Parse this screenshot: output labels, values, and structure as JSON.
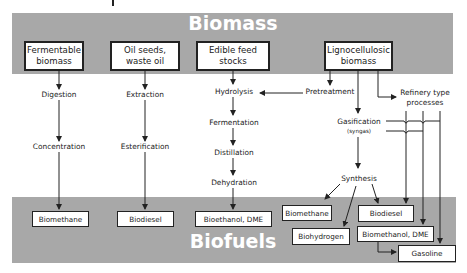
{
  "title_top": "Biomass",
  "title_bottom": "Biofuels",
  "sources": [
    {
      "label": "Fermentable biomass"
    },
    {
      "label": "Oil seeds, waste oil"
    },
    {
      "label": "Edible feed stocks"
    },
    {
      "label": "Lignocellulosic biomass"
    }
  ],
  "steps": {
    "digestion": "Digestion",
    "concentration": "Concentration",
    "extraction": "Extraction",
    "esterification": "Esterification",
    "hydrolysis": "Hydrolysis",
    "fermentation": "Fermentation",
    "distillation": "Distillation",
    "dehydration": "Dehydration",
    "pretreatment": "Pretreatment",
    "gasification": "Gasification",
    "syngas": "(syngas)",
    "synthesis": "Synthesis",
    "refinery": "Refinery type",
    "refinery2": "processes"
  },
  "outputs": {
    "biomethane_1": "Biomethane",
    "biodiesel_1": "Biodiesel",
    "bioethanol": "Bioethanol, DME",
    "biomethane_2": "Biomethane",
    "biohydrogen": "Biohydrogen",
    "biodiesel_2": "Biodiesel",
    "biomethanol": "Biomethanol, DME",
    "gasoline": "Gasoline"
  },
  "colors": {
    "band": "#a8a8a8",
    "line": "#222222"
  }
}
